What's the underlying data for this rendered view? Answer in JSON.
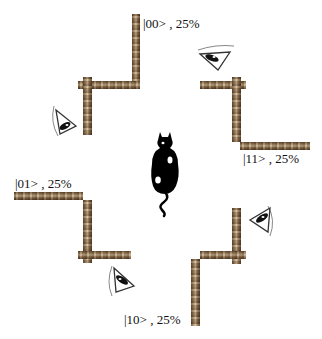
{
  "diagram": {
    "type": "quantum-cat-measurement-illustration",
    "center": {
      "figure": "black cat silhouette",
      "icon": "cat-icon"
    },
    "outcomes": [
      {
        "state": "|00>",
        "probability": "25%",
        "label": "|00> , 25%",
        "position": "top"
      },
      {
        "state": "|11>",
        "probability": "25%",
        "label": "|11> , 25%",
        "position": "right"
      },
      {
        "state": "|01>",
        "probability": "25%",
        "label": "|01> , 25%",
        "position": "left"
      },
      {
        "state": "|10>",
        "probability": "25%",
        "label": "|10> , 25%",
        "position": "bottom"
      }
    ],
    "observers": [
      {
        "icon": "eye-icon",
        "position": "top-left"
      },
      {
        "icon": "eye-icon",
        "position": "top-right"
      },
      {
        "icon": "eye-icon",
        "position": "bottom-left"
      },
      {
        "icon": "eye-icon",
        "position": "bottom-right"
      }
    ],
    "colors": {
      "wood_dark": "#4a3320",
      "wood_light": "#d4c1a2",
      "ink": "#111111"
    }
  }
}
